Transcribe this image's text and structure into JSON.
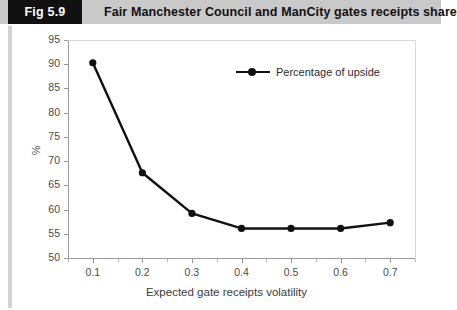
{
  "figure": {
    "badge": "Fig 5.9",
    "title": "Fair Manchester Council and ManCity gates receipts share"
  },
  "colors": {
    "badge_background": "#111111",
    "header_background": "#c9c9c9",
    "series": "#111111",
    "axis": "#9a9a9a",
    "tick_text": "#4a4a4a"
  },
  "chart_data": {
    "type": "line",
    "title": "",
    "xlabel": "Expected gate receipts volatility",
    "ylabel": "%",
    "x": [
      0.1,
      0.2,
      0.3,
      0.4,
      0.5,
      0.6,
      0.7
    ],
    "xlim": [
      0.05,
      0.75
    ],
    "ylim": [
      50,
      95
    ],
    "xticks": [
      "0.1",
      "0.2",
      "0.3",
      "0.4",
      "0.5",
      "0.6",
      "0.7"
    ],
    "yticks": [
      "50",
      "55",
      "60",
      "65",
      "70",
      "75",
      "80",
      "85",
      "90",
      "95"
    ],
    "grid": false,
    "legend_position": "upper right",
    "series": [
      {
        "name": "Percentage of upside",
        "values": [
          90.3,
          67.6,
          59.2,
          56.1,
          56.1,
          56.1,
          57.3
        ],
        "marker": "circle",
        "color": "#111111"
      }
    ]
  }
}
